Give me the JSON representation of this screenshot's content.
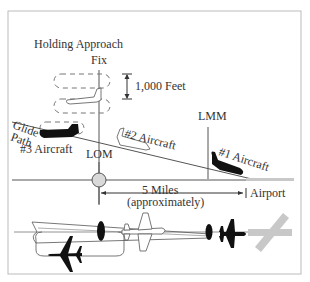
{
  "figure": {
    "labels": {
      "holding_fix": "Holding Approach",
      "holding_fix_line2": "Fix",
      "altitude_sep": "1,000 Feet",
      "glide_path_line1": "Glide",
      "glide_path_line2": "Path",
      "aircraft_3": "#3 Aircraft",
      "aircraft_2": "#2 Aircraft",
      "aircraft_1": "#1 Aircraft",
      "lom": "LOM",
      "lmm": "LMM",
      "distance": "5 Miles",
      "distance_note": "(approximately)",
      "airport": "Airport"
    },
    "colors": {
      "line": "#555555",
      "text": "#333333",
      "aircraft_dark": "#111111",
      "runway": "#c8c8c8",
      "marker_fill": "#d9d9d9",
      "frame": "#bbbbbb"
    }
  }
}
